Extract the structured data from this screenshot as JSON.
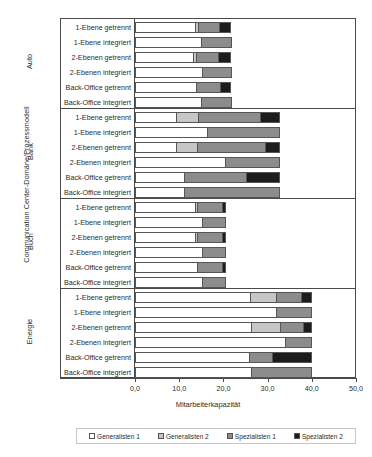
{
  "chart_data": {
    "type": "bar",
    "orientation": "horizontal",
    "stacked": true,
    "title": "",
    "xlabel": "Mitarbeiterkapazität",
    "ylabel": "Communication Center-Domäne/Prozessmodell",
    "xlim": [
      0,
      50
    ],
    "xticks": [
      0,
      10,
      20,
      30,
      40,
      50
    ],
    "xtick_labels": [
      "0,0",
      "10,0",
      "20,0",
      "30,0",
      "40,0",
      "50,0"
    ],
    "grid": false,
    "legend_position": "bottom",
    "series": [
      {
        "name": "Generalisten 1",
        "color": "#ffffff"
      },
      {
        "name": "Generalisten 2",
        "color": "#c6c6c6"
      },
      {
        "name": "Spezialisten 1",
        "color": "#8c8c8c"
      },
      {
        "name": "Spezialisten 2",
        "color": "#1c1c1c"
      }
    ],
    "groups": [
      {
        "name": "Auto",
        "rows": [
          {
            "label": "1-Ebene getrennt",
            "values": [
              13.6,
              0.6,
              4.8,
              2.8
            ],
            "total": 21.8
          },
          {
            "label": "1-Ebene integriert",
            "values": [
              15.0,
              0.0,
              6.9,
              0.0
            ],
            "total": 21.9
          },
          {
            "label": "2-Ebenen getrennt",
            "values": [
              13.2,
              0.7,
              4.9,
              3.0
            ],
            "total": 21.8
          },
          {
            "label": "2-Ebenen integriert",
            "values": [
              15.1,
              0.0,
              6.8,
              0.0
            ],
            "total": 21.9
          },
          {
            "label": "Back-Office getrennt",
            "values": [
              13.9,
              0.0,
              5.3,
              2.6
            ],
            "total": 21.8
          },
          {
            "label": "Back-Office integriert",
            "values": [
              15.0,
              0.0,
              6.9,
              0.0
            ],
            "total": 21.9
          }
        ]
      },
      {
        "name": "Bank",
        "rows": [
          {
            "label": "1-Ebene getrennt",
            "values": [
              9.2,
              5.1,
              13.9,
              4.6
            ],
            "total": 32.8
          },
          {
            "label": "1-Ebene integriert",
            "values": [
              16.3,
              0.0,
              16.5,
              0.0
            ],
            "total": 32.8
          },
          {
            "label": "2-Ebenen getrennt",
            "values": [
              9.3,
              4.7,
              15.4,
              3.5
            ],
            "total": 32.9
          },
          {
            "label": "2-Ebenen integriert",
            "values": [
              20.3,
              0.0,
              12.5,
              0.0
            ],
            "total": 32.8
          },
          {
            "label": "Back-Office getrennt",
            "values": [
              11.1,
              0.0,
              14.0,
              7.8
            ],
            "total": 32.9
          },
          {
            "label": "Back-Office integriert",
            "values": [
              11.0,
              0.0,
              21.8,
              0.0
            ],
            "total": 32.8
          }
        ]
      },
      {
        "name": "Buch",
        "rows": [
          {
            "label": "1-Ebene getrennt",
            "values": [
              13.6,
              0.4,
              5.7,
              1.0
            ],
            "total": 20.7
          },
          {
            "label": "1-Ebene integriert",
            "values": [
              15.1,
              0.0,
              5.6,
              0.0
            ],
            "total": 20.7
          },
          {
            "label": "2-Ebenen getrennt",
            "values": [
              13.5,
              0.5,
              5.6,
              1.1
            ],
            "total": 20.7
          },
          {
            "label": "2-Ebenen integriert",
            "values": [
              15.2,
              0.0,
              5.5,
              0.0
            ],
            "total": 20.7
          },
          {
            "label": "Back-Office getrennt",
            "values": [
              14.0,
              0.0,
              5.6,
              1.1
            ],
            "total": 20.7
          },
          {
            "label": "Back-Office integriert",
            "values": [
              15.1,
              0.0,
              5.6,
              0.0
            ],
            "total": 20.7
          }
        ]
      },
      {
        "name": "Energie",
        "rows": [
          {
            "label": "1-Ebene getrennt",
            "values": [
              26.0,
              5.9,
              5.6,
              2.6
            ],
            "total": 40.1
          },
          {
            "label": "1-Ebene integriert",
            "values": [
              31.9,
              0.0,
              8.2,
              0.0
            ],
            "total": 40.1
          },
          {
            "label": "2-Ebenen getrennt",
            "values": [
              26.2,
              6.6,
              5.2,
              2.1
            ],
            "total": 40.1
          },
          {
            "label": "2-Ebenen integriert",
            "values": [
              34.0,
              0.0,
              6.1,
              0.0
            ],
            "total": 40.1
          },
          {
            "label": "Back-Office getrennt",
            "values": [
              25.9,
              0.0,
              5.2,
              9.0
            ],
            "total": 40.1
          },
          {
            "label": "Back-Office integriert",
            "values": [
              26.2,
              0.0,
              13.9,
              0.0
            ],
            "total": 40.1
          }
        ]
      }
    ]
  },
  "legend": {
    "items": [
      {
        "label": "Generalisten 1"
      },
      {
        "label": "Generalisten 2"
      },
      {
        "label": "Spezialisten 1"
      },
      {
        "label": "Spezialisten 2"
      }
    ]
  }
}
